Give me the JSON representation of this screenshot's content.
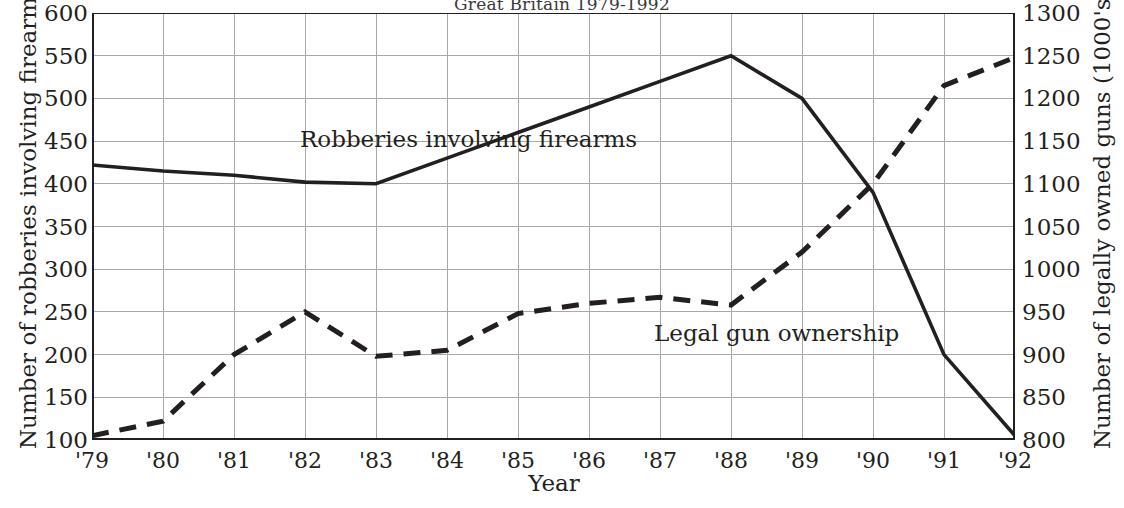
{
  "chart": {
    "title": "Great Britain 1979-1992",
    "xlabel": "Year",
    "ylabel_left": "Number of robberies involving firearms",
    "ylabel_right": "Number of legally owned guns (1000's)",
    "label_robberies": "Robberies involving firearms",
    "label_guns": "Legal gun ownership",
    "ink_color": "#231f20",
    "grid_color": "#a8a8a8"
  },
  "chart_data": {
    "type": "line",
    "title": "Great Britain 1979-1992",
    "xlabel": "Year",
    "ylabel": "Number of robberies involving firearms",
    "ylabel_secondary": "Number of legally owned guns (1000's)",
    "grid": true,
    "legend": "inline-annotations",
    "x": [
      "'79",
      "'80",
      "'81",
      "'82",
      "'83",
      "'84",
      "'85",
      "'86",
      "'87",
      "'88",
      "'89",
      "'90",
      "'91",
      "'92"
    ],
    "xtick_labels": [
      "'79",
      "'80",
      "'81",
      "'82",
      "'83",
      "'84",
      "'85",
      "'86",
      "'87",
      "'88",
      "'89",
      "'90",
      "'91",
      "'92"
    ],
    "ylim": [
      100,
      600
    ],
    "ytick_labels": [
      "100",
      "150",
      "200",
      "250",
      "300",
      "350",
      "400",
      "450",
      "500",
      "550",
      "600"
    ],
    "yticks": [
      100,
      150,
      200,
      250,
      300,
      350,
      400,
      450,
      500,
      550,
      600
    ],
    "ylim_secondary": [
      800,
      1300
    ],
    "ytick_labels_secondary": [
      "800",
      "850",
      "900",
      "950",
      "1000",
      "1050",
      "1100",
      "1150",
      "1200",
      "1250",
      "1300"
    ],
    "yticks_secondary": [
      800,
      850,
      900,
      950,
      1000,
      1050,
      1100,
      1150,
      1200,
      1250,
      1300
    ],
    "series": [
      {
        "name": "Robberies involving firearms",
        "axis": "left",
        "style": "solid",
        "values": [
          422,
          415,
          410,
          402,
          400,
          430,
          460,
          490,
          520,
          550,
          500,
          390,
          200,
          105
        ]
      },
      {
        "name": "Legal gun ownership",
        "axis": "right",
        "style": "dashed",
        "values": [
          805,
          822,
          900,
          950,
          898,
          905,
          948,
          960,
          967,
          958,
          1020,
          1100,
          1215,
          1248
        ]
      }
    ]
  }
}
